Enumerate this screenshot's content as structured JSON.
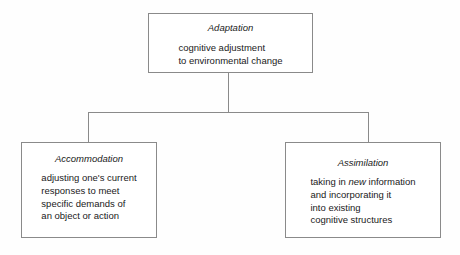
{
  "diagram": {
    "type": "hierarchy-tree",
    "line_color": "#8a8a8a",
    "box_border_color": "#8a8a8a",
    "background_color": "#fefefe",
    "text_color": "#1a1a1a",
    "nodes": {
      "root": {
        "title": "Adaptation",
        "body_line_1": "cognitive adjustment",
        "body_line_2": "to environmental change"
      },
      "left_child": {
        "title": "Accommodation",
        "body_line_1": "adjusting one's current",
        "body_line_2": "responses to meet",
        "body_line_3": "specific demands of",
        "body_line_4": "an object or action"
      },
      "right_child": {
        "title": "Assimilation",
        "body_line_1_before_emphasis": "taking in ",
        "body_line_1_emphasis": "new",
        "body_line_1_after_emphasis": " information",
        "body_line_2": "and incorporating it",
        "body_line_3": "into existing",
        "body_line_4": "cognitive structures"
      }
    }
  }
}
